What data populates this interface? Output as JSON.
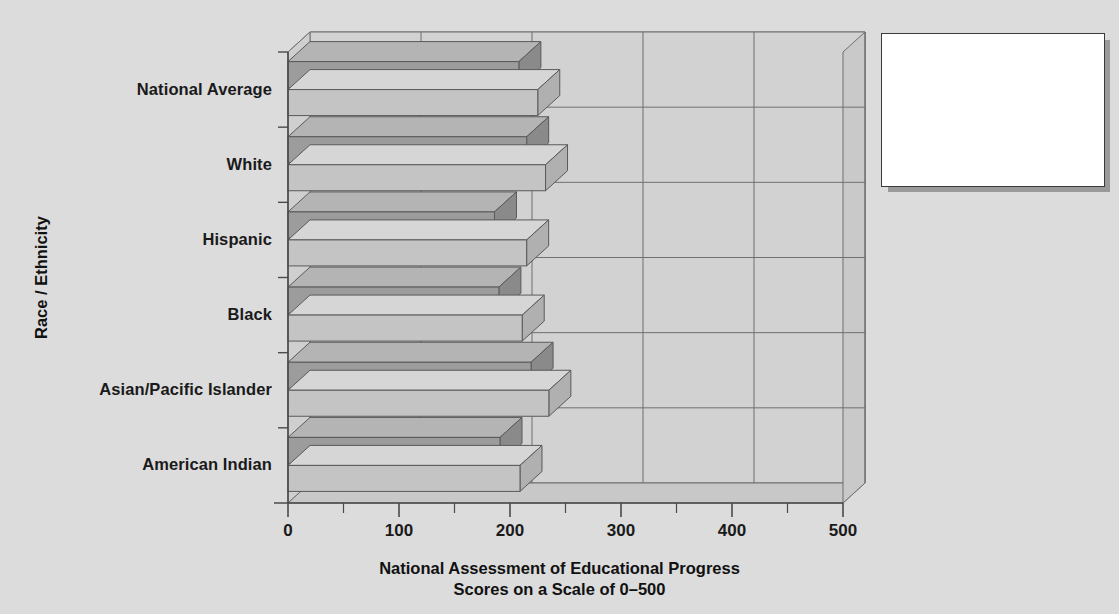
{
  "chart_data": {
    "type": "bar",
    "orientation": "horizontal",
    "title": "",
    "xlabel": "National Assessment of Educational Progress\nScores on a Scale of 0–500",
    "xlabel_line1": "National Assessment of Educational Progress",
    "xlabel_line2": "Scores on a Scale of 0–500",
    "ylabel": "Race / Ethnicity",
    "categories": [
      "National Average",
      "White",
      "Hispanic",
      "Black",
      "Asian/Pacific Islander",
      "American Indian"
    ],
    "series": [
      {
        "name": "Reading",
        "color": "#9a9a9a",
        "values": [
          208,
          215,
          186,
          190,
          219,
          191
        ]
      },
      {
        "name": "Mathematics",
        "color": "#c2c2c2",
        "values": [
          225,
          232,
          215,
          211,
          235,
          209
        ]
      }
    ],
    "xlim": [
      0,
      500
    ],
    "xticks": [
      0,
      100,
      200,
      300,
      400,
      500
    ],
    "xtick_labels": [
      "0",
      "100",
      "200",
      "300",
      "400",
      "500"
    ],
    "xminor_ticks": [
      50,
      150,
      250,
      350,
      450
    ],
    "grid": true,
    "legend_position": "top-right",
    "style": "3d-bar"
  },
  "legend": {
    "items": [
      {
        "label": "Reading",
        "swatch": "reading-swatch"
      },
      {
        "label": "Mathematics",
        "swatch": "mathematics-swatch"
      }
    ]
  },
  "colors": {
    "background": "#dcdcdc",
    "plot_wall": "#d2d2d2",
    "plot_floor": "#c8c8c8",
    "reading_front": "#9c9c9c",
    "reading_top": "#b4b4b4",
    "reading_side": "#8a8a8a",
    "math_front": "#c4c4c4",
    "math_top": "#d6d6d6",
    "math_side": "#b0b0b0",
    "axis": "#4a4a4a",
    "text": "#1a1a1a"
  }
}
